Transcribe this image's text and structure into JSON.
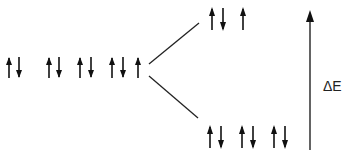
{
  "diagram": {
    "type": "energy-level-splitting",
    "stroke_color": "#222222",
    "label_delta_e": "ΔE",
    "left_group": {
      "name": "degenerate orbitals",
      "orbitals": [
        "up-down",
        "up-down",
        "up-down",
        "up-down",
        "up"
      ]
    },
    "upper_group": {
      "name": "higher energy set",
      "orbitals": [
        "up-down",
        "up"
      ]
    },
    "lower_group": {
      "name": "lower energy set",
      "orbitals": [
        "up-down",
        "up-down",
        "up-down"
      ]
    }
  }
}
